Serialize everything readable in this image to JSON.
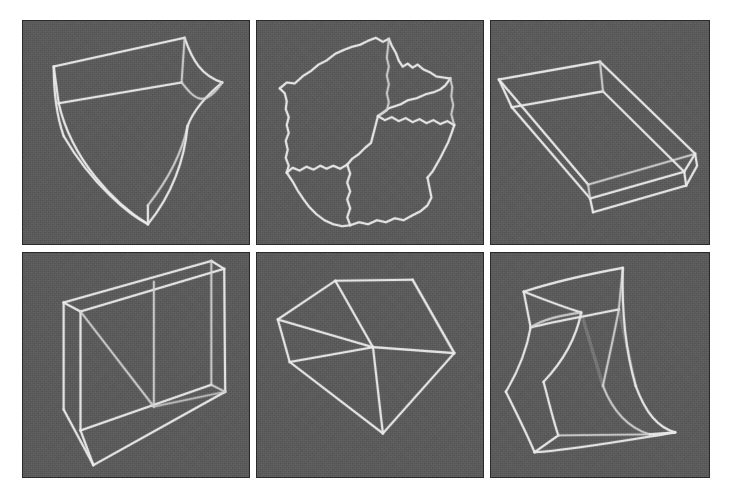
{
  "figure": {
    "background_color": "#ffffff",
    "panel_background_color": "#5b5b5b",
    "wire_color": "#e9e9e9",
    "panel_border_color": "#2a2a2a",
    "rows": 2,
    "columns": 3,
    "panel_count": 6,
    "caption": ""
  },
  "panels": [
    {
      "index": 1,
      "position": "top-left",
      "name": "tapered-curved-box",
      "description": "Wireframe of a tapering box with concave curved side faces narrowing to a point at the bottom",
      "shape_type": "curved-prism"
    },
    {
      "index": 2,
      "position": "top-center",
      "name": "noisy-irregular-cube",
      "description": "Wireframe cube with jagged irregular edges resembling a rough rock block",
      "shape_type": "perturbed-cube"
    },
    {
      "index": 3,
      "position": "top-right",
      "name": "open-shallow-tray",
      "description": "Wireframe of a shallow open rectangular tray seen from above",
      "shape_type": "open-box"
    },
    {
      "index": 4,
      "position": "bottom-left",
      "name": "open-top-bin",
      "description": "Wireframe of a tall open-top rectangular bin viewed looking down into it",
      "shape_type": "open-box"
    },
    {
      "index": 5,
      "position": "bottom-center",
      "name": "skewed-polyhedron",
      "description": "Wireframe of a distorted cube / polyhedron with straight slanted edges",
      "shape_type": "sheared-cube"
    },
    {
      "index": 6,
      "position": "bottom-right",
      "name": "hourglass-curved-box",
      "description": "Wireframe of an hourglass shaped box with pinched concave curved vertical faces",
      "shape_type": "curved-prism"
    }
  ]
}
